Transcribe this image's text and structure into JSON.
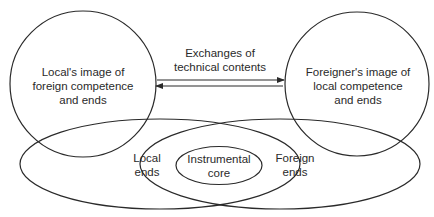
{
  "diagram": {
    "left_circle": {
      "lines": [
        "Local's image of",
        "foreign competence",
        "and ends"
      ]
    },
    "right_circle": {
      "lines": [
        "Foreigner's image of",
        "local competence",
        "and ends"
      ]
    },
    "exchange": {
      "lines": [
        "Exchanges of",
        "technical contents"
      ],
      "arrow_top_direction": "right",
      "arrow_bottom_direction": "left"
    },
    "left_ellipse": {
      "lines": [
        "Local",
        "ends"
      ]
    },
    "right_ellipse": {
      "lines": [
        "Foreign",
        "ends"
      ]
    },
    "core": {
      "lines": [
        "Instrumental",
        "core"
      ]
    },
    "colors": {
      "stroke": "#2a2a2a",
      "background": "#ffffff"
    }
  }
}
